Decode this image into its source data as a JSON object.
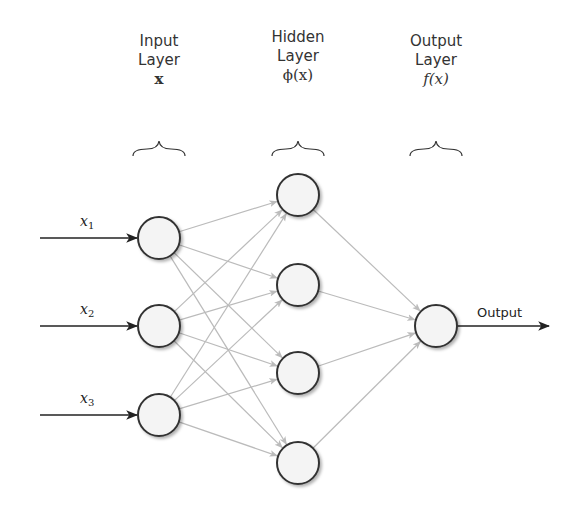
{
  "layers": [
    {
      "id": "input",
      "title_line1": "Input",
      "title_line2": "Layer",
      "symbol": "x",
      "node_count": 3
    },
    {
      "id": "hidden",
      "title_line1": "Hidden",
      "title_line2": "Layer",
      "symbol": "ϕ(x)",
      "node_count": 4
    },
    {
      "id": "output",
      "title_line1": "Output",
      "title_line2": "Layer",
      "symbol": "f(x)",
      "node_count": 1
    }
  ],
  "inputs": [
    {
      "var": "x",
      "sub": "1"
    },
    {
      "var": "x",
      "sub": "2"
    },
    {
      "var": "x",
      "sub": "3"
    }
  ],
  "output_label": "Output",
  "colors": {
    "node_stroke": "#333333",
    "node_fill": "#f4f4f4",
    "edge": "#bbbbbb",
    "io_arrow": "#222222"
  }
}
